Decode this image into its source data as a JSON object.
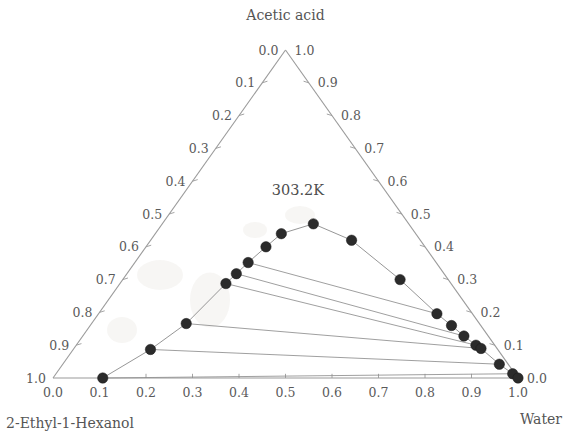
{
  "figure": {
    "title_apex": "Acetic acid",
    "label_bottom_left": "2-Ethyl-1-Hexanol",
    "label_bottom_right": "Water",
    "temperature_annotation": "303.2K"
  },
  "chart_data": {
    "type": "scatter",
    "plot_kind": "ternary-phase-diagram",
    "title": "Acetic acid",
    "subtitle": "303.2K",
    "components": {
      "top": "Acetic acid",
      "bottom_left": "2-Ethyl-1-Hexanol",
      "bottom_right": "Water"
    },
    "axes": {
      "bottom": {
        "name": "Water",
        "label": "2-Ethyl-1-Hexanol",
        "ticks": [
          "0.0",
          "0.1",
          "0.2",
          "0.3",
          "0.4",
          "0.5",
          "0.6",
          "0.7",
          "0.8",
          "0.9",
          "1.0"
        ],
        "range": [
          0.0,
          1.0
        ],
        "direction": "left-to-right"
      },
      "left": {
        "name": "2-Ethyl-1-Hexanol",
        "ticks": [
          "0.0",
          "0.1",
          "0.2",
          "0.3",
          "0.4",
          "0.5",
          "0.6",
          "0.7",
          "0.8",
          "0.9",
          "1.0"
        ],
        "range": [
          0.0,
          1.0
        ],
        "direction": "top-to-bottom"
      },
      "right": {
        "name": "Acetic acid",
        "ticks": [
          "1.0",
          "0.9",
          "0.8",
          "0.7",
          "0.6",
          "0.5",
          "0.4",
          "0.3",
          "0.2",
          "0.1",
          "0.0"
        ],
        "range": [
          0.0,
          1.0
        ],
        "direction": "top-to-bottom"
      }
    },
    "grid": false,
    "legend": "none",
    "series": [
      {
        "name": "binodal-curve-left-branch",
        "description": "Organic (2-Ethyl-1-Hexanol rich) phase equilibrium points",
        "points": [
          {
            "water": 0.107,
            "acid": 0.0,
            "hexanol": 0.893
          },
          {
            "water": 0.182,
            "acid": 0.087,
            "hexanol": 0.731
          },
          {
            "water": 0.244,
            "acid": 0.166,
            "hexanol": 0.59
          },
          {
            "water": 0.32,
            "acid": 0.288,
            "hexanol": 0.392
          },
          {
            "water": 0.345,
            "acid": 0.318,
            "hexanol": 0.337
          },
          {
            "water": 0.376,
            "acid": 0.352,
            "hexanol": 0.272
          },
          {
            "water": 0.43,
            "acid": 0.4,
            "hexanol": 0.17
          },
          {
            "water": 0.484,
            "acid": 0.44,
            "hexanol": 0.076
          },
          {
            "water": 0.613,
            "acid": 0.47,
            "hexanol": -0.083
          }
        ]
      },
      {
        "name": "binodal-curve-right-branch",
        "description": "Aqueous (water rich) phase equilibrium points",
        "points": [
          {
            "water": 0.745,
            "acid": 0.42,
            "hexanol": -0.165
          },
          {
            "water": 0.852,
            "acid": 0.3,
            "hexanol": -0.152
          },
          {
            "water": 0.905,
            "acid": 0.196,
            "hexanol": -0.101
          },
          {
            "water": 0.925,
            "acid": 0.16,
            "hexanol": -0.085
          },
          {
            "water": 0.94,
            "acid": 0.128,
            "hexanol": -0.068
          },
          {
            "water": 0.955,
            "acid": 0.1,
            "hexanol": -0.055
          },
          {
            "water": 0.962,
            "acid": 0.09,
            "hexanol": -0.052
          },
          {
            "water": 0.98,
            "acid": 0.042,
            "hexanol": -0.022
          },
          {
            "water": 0.995,
            "acid": 0.013,
            "hexanol": -0.008
          },
          {
            "water": 1.0,
            "acid": 0.0,
            "hexanol": 0.0
          }
        ]
      }
    ],
    "tie_lines": [
      {
        "left": {
          "water": 0.376,
          "acid": 0.352
        },
        "right": {
          "water": 0.905,
          "acid": 0.196
        }
      },
      {
        "left": {
          "water": 0.345,
          "acid": 0.318
        },
        "right": {
          "water": 0.94,
          "acid": 0.128
        }
      },
      {
        "left": {
          "water": 0.32,
          "acid": 0.288
        },
        "right": {
          "water": 0.955,
          "acid": 0.1
        }
      },
      {
        "left": {
          "water": 0.244,
          "acid": 0.166
        },
        "right": {
          "water": 0.962,
          "acid": 0.09
        }
      },
      {
        "left": {
          "water": 0.182,
          "acid": 0.087
        },
        "right": {
          "water": 0.98,
          "acid": 0.042
        }
      },
      {
        "left": {
          "water": 0.107,
          "acid": 0.0
        },
        "right": {
          "water": 0.995,
          "acid": 0.013
        }
      }
    ]
  },
  "geometry": {
    "apex_x": 285.5,
    "apex_y": 50.0,
    "left_x": 53.0,
    "right_x": 518.0,
    "base_y": 378.0,
    "point_radius": 5.2
  },
  "colors": {
    "axis": "#9a9a9a",
    "point": "#2b2b2b",
    "curve": "#8a8a8a",
    "tie_line": "#8e8e8e",
    "text": "#555555",
    "background": "#ffffff"
  }
}
